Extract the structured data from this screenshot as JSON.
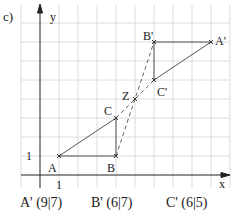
{
  "part_label": "c)",
  "axes": {
    "x_label": "x",
    "y_label": "y",
    "x_tick_label": "1",
    "y_tick_label": "1"
  },
  "points": {
    "A": {
      "label": "A",
      "x": 1,
      "y": 1
    },
    "B": {
      "label": "B",
      "x": 4,
      "y": 1
    },
    "C": {
      "label": "C",
      "x": 4,
      "y": 3
    },
    "Z": {
      "label": "Z",
      "x": 5,
      "y": 4
    },
    "A_prime": {
      "label": "A'",
      "x": 9,
      "y": 7
    },
    "B_prime": {
      "label": "B'",
      "x": 6,
      "y": 7
    },
    "C_prime": {
      "label": "C'",
      "x": 6,
      "y": 5
    }
  },
  "answers": [
    {
      "text": "A' (9|7)"
    },
    {
      "text": "B' (6|7)"
    },
    {
      "text": "C' (6|5)"
    }
  ],
  "colors": {
    "grid": "#dcdcdc",
    "axis": "#222222",
    "line": "#555555"
  }
}
